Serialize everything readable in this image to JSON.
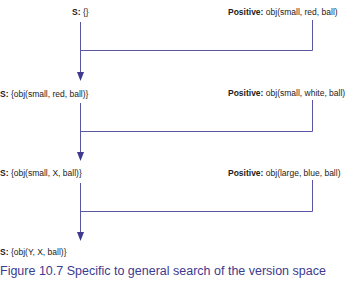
{
  "diagram": {
    "line_color": "#4a4790",
    "steps": [
      {
        "s_key": "S:",
        "s_value": "{}",
        "pos_key": "Positive:",
        "pos_value": "obj(small, red, ball)"
      },
      {
        "s_key": "S:",
        "s_value": "{obj(small, red, ball)}",
        "pos_key": "Positive:",
        "pos_value": "obj(small, white, ball)"
      },
      {
        "s_key": "S:",
        "s_value": "{obj(small, X, ball)}",
        "pos_key": "Positive:",
        "pos_value": "obj(large, blue, ball)"
      },
      {
        "s_key": "S:",
        "s_value": "{obj(Y, X, ball)}"
      }
    ]
  },
  "caption": "Figure 10.7 Specific to general search of the version space"
}
